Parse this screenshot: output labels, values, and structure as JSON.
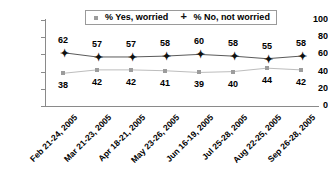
{
  "chart_data": {
    "type": "line",
    "title": "",
    "xlabel": "",
    "ylabel": "",
    "ylim": [
      0,
      100
    ],
    "yticks": [
      100,
      80,
      60,
      40,
      20,
      0
    ],
    "grid": false,
    "legend_position": "top-center",
    "categories": [
      "Feb 21-24, 2005",
      "Mar 21-23, 2005",
      "Apr 18-21, 2005",
      "May 23-26, 2005",
      "Jun 16-19, 2005",
      "Jul 25-28, 2005",
      "Aug 22-25, 2005",
      "Sep 26-28, 2005"
    ],
    "series": [
      {
        "name": "% Yes, worried",
        "marker": "square",
        "color": "#9c9c9c",
        "values": [
          38,
          42,
          42,
          41,
          39,
          40,
          44,
          42
        ],
        "label_position": "below"
      },
      {
        "name": "% No, not worried",
        "marker": "plus",
        "color": "#111111",
        "values": [
          62,
          57,
          57,
          58,
          60,
          58,
          55,
          58
        ],
        "label_position": "above"
      }
    ]
  },
  "legend": {
    "entries": [
      {
        "label": "% Yes, worried",
        "marker": "square-marker-icon"
      },
      {
        "label": "% No, not worried",
        "marker": "plus-marker-icon"
      }
    ]
  }
}
